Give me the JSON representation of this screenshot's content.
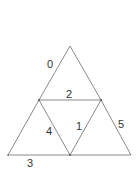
{
  "diagram": {
    "type": "subdivided-triangle",
    "vertices": {
      "apex": [
        70,
        46
      ],
      "mid_left": [
        39,
        100
      ],
      "mid_right": [
        101,
        100
      ],
      "bottom_left": [
        8,
        155
      ],
      "bottom_mid": [
        70,
        155
      ],
      "bottom_right": [
        131,
        155
      ]
    },
    "edges": [
      {
        "id": "edge-0",
        "label": "0",
        "from": "apex",
        "to": "mid_left",
        "label_pos": [
          50,
          68
        ]
      },
      {
        "id": "edge-1",
        "label": "1",
        "from": "bottom_mid",
        "to": "mid_right",
        "label_pos": [
          79,
          130
        ]
      },
      {
        "id": "edge-2",
        "label": "2",
        "from": "mid_left",
        "to": "mid_right",
        "label_pos": [
          69,
          98
        ]
      },
      {
        "id": "edge-3",
        "label": "3",
        "from": "bottom_left",
        "to": "bottom_mid",
        "label_pos": [
          30,
          167
        ]
      },
      {
        "id": "edge-4",
        "label": "4",
        "from": "mid_left",
        "to": "bottom_mid",
        "label_pos": [
          49,
          135
        ]
      },
      {
        "id": "edge-5",
        "label": "5",
        "from": "mid_right",
        "to": "bottom_right",
        "label_pos": [
          121,
          128
        ]
      }
    ],
    "unlabeled_edges": [
      {
        "from": "apex",
        "to": "mid_right"
      },
      {
        "from": "mid_left",
        "to": "bottom_left"
      },
      {
        "from": "bottom_mid",
        "to": "bottom_right"
      }
    ],
    "colors": {
      "stroke": "#8a8a8a",
      "text": "#333333",
      "background": "#ffffff"
    }
  }
}
